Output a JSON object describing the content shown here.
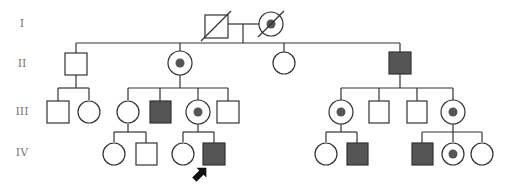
{
  "generations": [
    {
      "label": "I",
      "y": 24
    },
    {
      "label": "II",
      "y": 64
    },
    {
      "label": "III",
      "y": 112
    },
    {
      "label": "IV",
      "y": 153
    }
  ],
  "legend_colors": {
    "line": "#333333",
    "affected_fill": "#555555",
    "carrier_dot": "#555555",
    "unaffected_fill": "#ffffff"
  },
  "individuals": [
    {
      "id": "I-1",
      "sex": "male",
      "status": "unaffected",
      "deceased": true,
      "x": 216,
      "y": 26
    },
    {
      "id": "I-2",
      "sex": "female",
      "status": "carrier",
      "deceased": true,
      "x": 271,
      "y": 24
    },
    {
      "id": "II-1",
      "sex": "male",
      "status": "unaffected",
      "x": 76,
      "y": 64
    },
    {
      "id": "II-2",
      "sex": "female",
      "status": "carrier",
      "x": 180,
      "y": 63
    },
    {
      "id": "II-3",
      "sex": "female",
      "status": "unaffected",
      "x": 284,
      "y": 63
    },
    {
      "id": "II-4",
      "sex": "male",
      "status": "affected",
      "x": 400,
      "y": 63
    },
    {
      "id": "III-1",
      "sex": "male",
      "status": "unaffected",
      "x": 58,
      "y": 112
    },
    {
      "id": "III-2",
      "sex": "female",
      "status": "unaffected",
      "x": 89,
      "y": 112
    },
    {
      "id": "III-3",
      "sex": "female",
      "status": "unaffected",
      "x": 128,
      "y": 112
    },
    {
      "id": "III-4",
      "sex": "male",
      "status": "affected",
      "x": 160,
      "y": 112
    },
    {
      "id": "III-5",
      "sex": "female",
      "status": "carrier",
      "x": 198,
      "y": 112
    },
    {
      "id": "III-6",
      "sex": "male",
      "status": "unaffected",
      "x": 228,
      "y": 112
    },
    {
      "id": "III-7",
      "sex": "female",
      "status": "carrier",
      "x": 341,
      "y": 112
    },
    {
      "id": "III-8",
      "sex": "male",
      "status": "unaffected",
      "x": 379,
      "y": 112
    },
    {
      "id": "III-9",
      "sex": "male",
      "status": "unaffected",
      "x": 417,
      "y": 112
    },
    {
      "id": "III-10",
      "sex": "female",
      "status": "carrier",
      "x": 453,
      "y": 112
    },
    {
      "id": "IV-1",
      "sex": "female",
      "status": "unaffected",
      "x": 114,
      "y": 154
    },
    {
      "id": "IV-2",
      "sex": "male",
      "status": "unaffected",
      "x": 146,
      "y": 154
    },
    {
      "id": "IV-3",
      "sex": "female",
      "status": "unaffected",
      "x": 183,
      "y": 154
    },
    {
      "id": "IV-4",
      "sex": "male",
      "status": "affected",
      "proband": true,
      "x": 214,
      "y": 154
    },
    {
      "id": "IV-5",
      "sex": "female",
      "status": "unaffected",
      "x": 326,
      "y": 154
    },
    {
      "id": "IV-6",
      "sex": "male",
      "status": "affected",
      "x": 357,
      "y": 154
    },
    {
      "id": "IV-7",
      "sex": "male",
      "status": "affected",
      "x": 422,
      "y": 154
    },
    {
      "id": "IV-8",
      "sex": "female",
      "status": "carrier",
      "x": 453,
      "y": 154
    },
    {
      "id": "IV-9",
      "sex": "female",
      "status": "unaffected",
      "x": 482,
      "y": 154
    }
  ],
  "proband_marker": {
    "target": "IV-4",
    "icon": "arrow-up-right"
  }
}
